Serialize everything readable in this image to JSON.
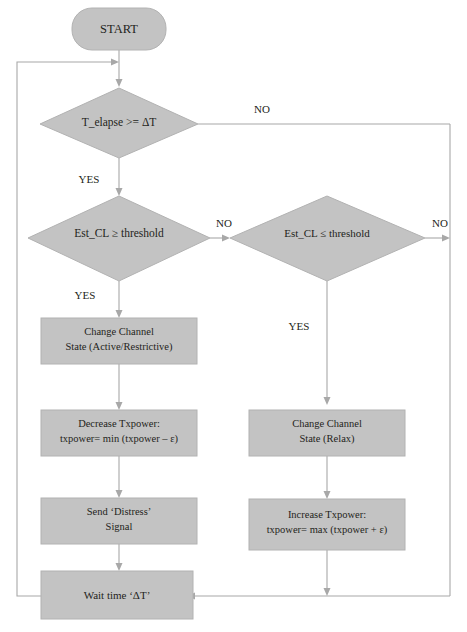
{
  "diagram": {
    "colors": {
      "shape_fill": "#c3c3c3",
      "shape_stroke": "#b2b2b2",
      "edge": "#a8a8a8",
      "text": "#231f20",
      "background": "#ffffff"
    },
    "nodes": {
      "start": {
        "type": "terminator",
        "label": "START"
      },
      "decision_time": {
        "type": "decision",
        "label": "T_elapse >= ΔT"
      },
      "decision_cl_ge": {
        "type": "decision",
        "label": "Est_CL ≥ threshold"
      },
      "decision_cl_le": {
        "type": "decision",
        "label": "Est_CL ≤ threshold"
      },
      "change_channel_active": {
        "type": "process",
        "line1": "Change Channel",
        "line2": "State (Active/Restrictive)"
      },
      "decrease_txpower": {
        "type": "process",
        "line1": "Decrease Txpower:",
        "line2": "txpower= min (txpower – ε)"
      },
      "send_distress": {
        "type": "process",
        "line1": "Send ‘Distress’",
        "line2": "Signal"
      },
      "change_channel_relax": {
        "type": "process",
        "line1": "Change Channel",
        "line2": "State (Relax)"
      },
      "increase_txpower": {
        "type": "process",
        "line1": "Increase Txpower:",
        "line2": "txpower= max (txpower + ε)"
      },
      "wait_time": {
        "type": "process",
        "line1": "Wait time ‘ΔT’"
      }
    },
    "edge_labels": {
      "time_no": "NO",
      "time_yes": "YES",
      "cl_ge_no": "NO",
      "cl_ge_yes": "YES",
      "cl_le_no": "NO",
      "cl_le_yes": "YES"
    }
  }
}
